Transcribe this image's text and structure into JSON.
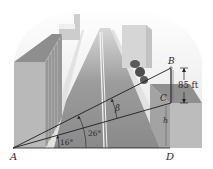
{
  "figure": {
    "type": "trigonometry-diagram"
  },
  "points": {
    "A": "A",
    "B": "B",
    "C": "C",
    "D": "D"
  },
  "measurements": {
    "height_BC": "85 ft",
    "height_CD": "h"
  },
  "angles": {
    "angle_CAD": "16°",
    "angle_BAD": "26°",
    "angle_BAC": "β"
  },
  "colors": {
    "road": "#8a8a8a",
    "building_front": "#b8b8b8",
    "building_top": "#9a9a9a",
    "lines": "#222222",
    "background": "#ffffff"
  }
}
